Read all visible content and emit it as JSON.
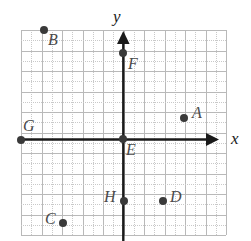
{
  "figure": {
    "type": "coordinate-plane",
    "axis_labels": {
      "x": "x",
      "y": "y"
    },
    "grid": {
      "columns": 10,
      "rows": 10,
      "cell_size_px": 20.5,
      "minor_subdivision": 2,
      "major_color": "#b9b9b9",
      "minor_color": "#c9c9c9"
    },
    "axis_color": "#1a1a1a",
    "point_color": "#3a3a3a",
    "origin_grid_units": {
      "x": 5,
      "y": 5
    }
  },
  "points": [
    {
      "label": "A",
      "px": 184,
      "py": 118,
      "grid_x": 3,
      "grid_y": 1,
      "label_dx": 8,
      "label_dy": -13
    },
    {
      "label": "B",
      "px": 44,
      "py": 30,
      "grid_x": -4,
      "grid_y": 5,
      "label_dx": 4,
      "label_dy": 2
    },
    {
      "label": "C",
      "px": 63,
      "py": 223,
      "grid_x": -3,
      "grid_y": -4,
      "label_dx": -18,
      "label_dy": -12
    },
    {
      "label": "D",
      "px": 163,
      "py": 201,
      "grid_x": 2,
      "grid_y": -3,
      "label_dx": 7,
      "label_dy": -12
    },
    {
      "label": "E",
      "px": 123,
      "py": 139,
      "grid_x": 0,
      "grid_y": 0,
      "label_dx": 3,
      "label_dy": 3
    },
    {
      "label": "F",
      "px": 123,
      "py": 53,
      "grid_x": 0,
      "grid_y": 4,
      "label_dx": 5,
      "label_dy": 3
    },
    {
      "label": "G",
      "px": 21,
      "py": 140,
      "grid_x": -5,
      "grid_y": 0,
      "label_dx": 2,
      "label_dy": -22
    },
    {
      "label": "H",
      "px": 124,
      "py": 201,
      "grid_x": 0,
      "grid_y": -3,
      "label_dx": -20,
      "label_dy": -12
    }
  ],
  "chart_data": {
    "type": "scatter",
    "title": "",
    "xlabel": "x",
    "ylabel": "y",
    "xlim": [
      -5,
      5
    ],
    "ylim": [
      -5,
      5
    ],
    "grid": true,
    "legend": "none",
    "series": [
      {
        "name": "labeled points",
        "points": [
          {
            "label": "A",
            "x": 3,
            "y": 1
          },
          {
            "label": "B",
            "x": -4,
            "y": 5
          },
          {
            "label": "C",
            "x": -3,
            "y": -4
          },
          {
            "label": "D",
            "x": 2,
            "y": -3
          },
          {
            "label": "E",
            "x": 0,
            "y": 0
          },
          {
            "label": "F",
            "x": 0,
            "y": 4
          },
          {
            "label": "G",
            "x": -5,
            "y": 0
          },
          {
            "label": "H",
            "x": 0,
            "y": -3
          }
        ]
      }
    ]
  }
}
